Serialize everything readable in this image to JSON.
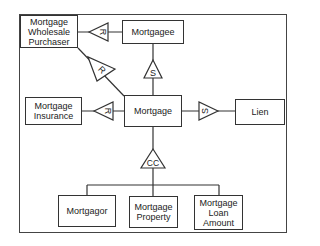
{
  "diagram": {
    "entities": {
      "wholesale": "Mortgage Wholesale Purchaser",
      "mortgagee": "Mortgagee",
      "insurance": "Mortgage Insurance",
      "mortgage": "Mortgage",
      "lien": "Lien",
      "mortgagor": "Mortgagor",
      "property": "Mortgage Property",
      "loan_amount": "Mortgage Loan Amount"
    },
    "relationships": {
      "wholesale_mortgagee": "R",
      "wholesale_mortgage": "R",
      "mortgagee_mortgage": "S",
      "insurance_mortgage": "R",
      "mortgage_lien": "S",
      "composition": "CC"
    }
  }
}
